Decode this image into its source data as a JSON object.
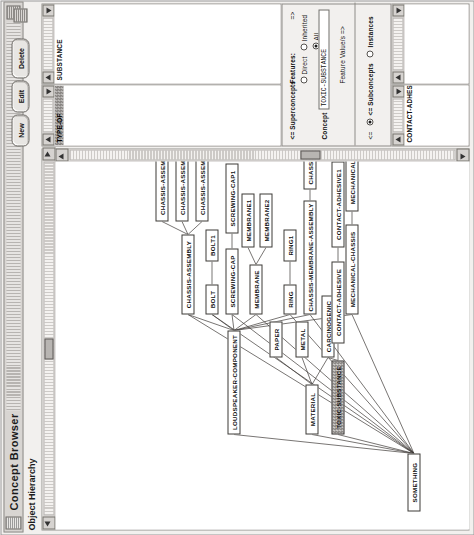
{
  "window": {
    "title": "Concept Browser",
    "subtitle": "Object Hierarchy",
    "grip_icon": "window-grip-icon",
    "menu_icon": "window-menu-icon"
  },
  "graph": {
    "title": "Object Hierarchy",
    "nodes": [
      {
        "id": "something",
        "label": "SOMETHING",
        "x": 18,
        "y": 352,
        "w": 58,
        "h": 13,
        "selected": false
      },
      {
        "id": "material",
        "label": "MATERIAL",
        "x": 95,
        "y": 250,
        "w": 50,
        "h": 13,
        "selected": false
      },
      {
        "id": "paper",
        "label": "PAPER",
        "x": 172,
        "y": 214,
        "w": 36,
        "h": 13,
        "selected": false
      },
      {
        "id": "metal",
        "label": "METAL",
        "x": 172,
        "y": 240,
        "w": 36,
        "h": 13,
        "selected": false
      },
      {
        "id": "carcinogenic",
        "label": "CARCINOGENIC",
        "x": 172,
        "y": 266,
        "w": 62,
        "h": 13,
        "selected": false
      },
      {
        "id": "toxic-substance",
        "label": "TOXIC-SUBSTANCE",
        "x": 95,
        "y": 276,
        "w": 74,
        "h": 13,
        "selected": true
      },
      {
        "id": "contact-adhesive",
        "label": "CONTACT-ADHESIVE",
        "x": 186,
        "y": 276,
        "w": 82,
        "h": 13,
        "selected": false
      },
      {
        "id": "contact-adhesive1",
        "label": "CONTACT-ADHESIVE1",
        "x": 282,
        "y": 276,
        "w": 86,
        "h": 13,
        "selected": false
      },
      {
        "id": "loudspeaker-component",
        "label": "LOUDSPEAKER-COMPONENT",
        "x": 95,
        "y": 172,
        "w": 104,
        "h": 13,
        "selected": false
      },
      {
        "id": "membrane",
        "label": "MEMBRANE",
        "x": 215,
        "y": 194,
        "w": 50,
        "h": 13,
        "selected": false
      },
      {
        "id": "membrane1",
        "label": "MEMBRANE1",
        "x": 282,
        "y": 186,
        "w": 54,
        "h": 13,
        "selected": false
      },
      {
        "id": "membrane2",
        "label": "MEMBRANE2",
        "x": 282,
        "y": 204,
        "w": 54,
        "h": 13,
        "selected": false
      },
      {
        "id": "chassis-assembly",
        "label": "CHASSIS-ASSEMBLY",
        "x": 215,
        "y": 126,
        "w": 80,
        "h": 13,
        "selected": false
      },
      {
        "id": "chassis-assembly1",
        "label": "CHASSIS-ASSEMBLY1",
        "x": 308,
        "y": 140,
        "w": 84,
        "h": 13,
        "selected": false
      },
      {
        "id": "chassis-assembly2",
        "label": "CHASSIS-ASSEMBLY2",
        "x": 308,
        "y": 120,
        "w": 84,
        "h": 13,
        "selected": false
      },
      {
        "id": "chassis-assembly3",
        "label": "CHASSIS-ASSEMBLY3",
        "x": 308,
        "y": 100,
        "w": 84,
        "h": 13,
        "selected": false
      },
      {
        "id": "bolt",
        "label": "BOLT",
        "x": 215,
        "y": 150,
        "w": 30,
        "h": 13,
        "selected": false
      },
      {
        "id": "bolt1",
        "label": "BOLT1",
        "x": 268,
        "y": 150,
        "w": 32,
        "h": 13,
        "selected": false
      },
      {
        "id": "screwing-cap",
        "label": "SCREWING-CAP",
        "x": 215,
        "y": 170,
        "w": 66,
        "h": 13,
        "selected": false
      },
      {
        "id": "screwing-cap1",
        "label": "SCREWING-CAP1",
        "x": 296,
        "y": 170,
        "w": 70,
        "h": 13,
        "selected": false
      },
      {
        "id": "ring",
        "label": "RING",
        "x": 215,
        "y": 228,
        "w": 30,
        "h": 13,
        "selected": false
      },
      {
        "id": "ring1",
        "label": "RING1",
        "x": 268,
        "y": 228,
        "w": 32,
        "h": 13,
        "selected": false
      },
      {
        "id": "chassis-membrane-assembly",
        "label": "CHASSIS-MEMBRANE-ASSEMBLY",
        "x": 215,
        "y": 248,
        "w": 114,
        "h": 13,
        "selected": false
      },
      {
        "id": "chassis-membrane-assembly1",
        "label": "CHASSIS-MEMBRANE-ASSEMBLY1",
        "x": 340,
        "y": 248,
        "w": 122,
        "h": 13,
        "selected": false
      },
      {
        "id": "mechanical-chassis",
        "label": "MECHANICAL-CHASSIS",
        "x": 215,
        "y": 290,
        "w": 90,
        "h": 13,
        "selected": false
      },
      {
        "id": "mechanical-chassis1",
        "label": "MECHANICAL-CHASSIS1",
        "x": 318,
        "y": 290,
        "w": 94,
        "h": 13,
        "selected": false
      }
    ],
    "edges": [
      [
        "something",
        "material"
      ],
      [
        "something",
        "toxic-substance"
      ],
      [
        "something",
        "loudspeaker-component"
      ],
      [
        "something",
        "membrane"
      ],
      [
        "something",
        "bolt"
      ],
      [
        "something",
        "screwing-cap"
      ],
      [
        "something",
        "ring"
      ],
      [
        "something",
        "chassis-membrane-assembly"
      ],
      [
        "something",
        "mechanical-chassis"
      ],
      [
        "something",
        "chassis-assembly"
      ],
      [
        "material",
        "paper"
      ],
      [
        "material",
        "metal"
      ],
      [
        "material",
        "carcinogenic"
      ],
      [
        "toxic-substance",
        "carcinogenic"
      ],
      [
        "toxic-substance",
        "contact-adhesive"
      ],
      [
        "contact-adhesive",
        "contact-adhesive1"
      ],
      [
        "loudspeaker-component",
        "membrane"
      ],
      [
        "loudspeaker-component",
        "bolt"
      ],
      [
        "loudspeaker-component",
        "screwing-cap"
      ],
      [
        "loudspeaker-component",
        "ring"
      ],
      [
        "loudspeaker-component",
        "chassis-membrane-assembly"
      ],
      [
        "loudspeaker-component",
        "mechanical-chassis"
      ],
      [
        "loudspeaker-component",
        "chassis-assembly"
      ],
      [
        "membrane",
        "membrane1"
      ],
      [
        "membrane",
        "membrane2"
      ],
      [
        "chassis-assembly",
        "chassis-assembly1"
      ],
      [
        "chassis-assembly",
        "chassis-assembly2"
      ],
      [
        "chassis-assembly",
        "chassis-assembly3"
      ],
      [
        "bolt",
        "bolt1"
      ],
      [
        "screwing-cap",
        "screwing-cap1"
      ],
      [
        "ring",
        "ring1"
      ],
      [
        "chassis-membrane-assembly",
        "chassis-membrane-assembly1"
      ],
      [
        "mechanical-chassis",
        "mechanical-chassis1"
      ]
    ],
    "hscroll": {
      "thumb_pos_pct": 44,
      "thumb_len_pct": 6
    },
    "vscroll": {
      "thumb_pos_pct": 60,
      "thumb_len_pct": 5
    }
  },
  "relations_panel": {
    "items": [
      {
        "label": "TYPE-OF",
        "selected": true
      }
    ]
  },
  "superconcepts_panel": {
    "items": [
      {
        "label": "SUBSTANCE",
        "selected": false
      }
    ]
  },
  "subconcepts_panel": {
    "items": [
      {
        "label": "CONTACT-ADHESIVE",
        "selected": false
      }
    ]
  },
  "instances_panel": {
    "items": []
  },
  "form": {
    "features_label": "Features:",
    "features_options": [
      {
        "label": "Direct",
        "selected": false
      },
      {
        "label": "Inherited",
        "selected": false
      },
      {
        "label": "All",
        "selected": true
      }
    ],
    "concept_label": "Concept",
    "concept_value": "TOXIC-SUBSTANCE",
    "feature_values_label": "Feature Value/s =>",
    "superconcepts_label": "<= Superconcepts",
    "subconcepts_label": "<= Subconcepts",
    "instances_label": "Instances",
    "features_arrow_label": "=>",
    "subconcepts_prefix": "<="
  },
  "buttons": {
    "new": "New",
    "edit": "Edit",
    "delete": "Delete"
  }
}
